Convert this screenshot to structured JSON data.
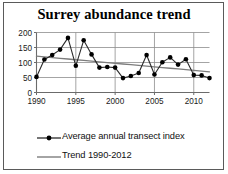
{
  "chart_data": {
    "type": "line",
    "title": "Surrey abundance trend",
    "xlabel": "",
    "ylabel": "",
    "xlim": [
      1990,
      2012
    ],
    "ylim": [
      0,
      200
    ],
    "grid": true,
    "legend_position": "bottom-left",
    "x": [
      1990,
      1991,
      1992,
      1993,
      1994,
      1995,
      1996,
      1997,
      1998,
      1999,
      2000,
      2001,
      2002,
      2003,
      2004,
      2005,
      2006,
      2007,
      2008,
      2009,
      2010,
      2011,
      2012
    ],
    "y_ticks": [
      0,
      50,
      100,
      150,
      200
    ],
    "y_tick_labels": [
      "0",
      "50",
      "100",
      "150",
      "200"
    ],
    "x_ticks": [
      1990,
      1995,
      2000,
      2005,
      2010
    ],
    "x_tick_labels": [
      "1990",
      "1995",
      "2000",
      "2005",
      "2010"
    ],
    "series": [
      {
        "name": "Average annual transect index",
        "style": "line-with-markers",
        "color": "#000000",
        "values": [
          52,
          110,
          125,
          143,
          182,
          89,
          174,
          127,
          83,
          85,
          83,
          48,
          55,
          65,
          125,
          60,
          101,
          117,
          93,
          111,
          58,
          57,
          48
        ]
      },
      {
        "name": "Trend 1990-2012",
        "style": "line",
        "color": "#7d7d7d",
        "values": [
          121,
          118.6,
          116.3,
          113.9,
          111.6,
          109.2,
          106.8,
          104.5,
          102.1,
          99.7,
          97.4,
          95,
          92.6,
          90.3,
          87.9,
          85.5,
          83.2,
          80.8,
          78.5,
          76.1,
          73.7,
          71.4,
          69
        ]
      }
    ],
    "legend": [
      {
        "label": "Average annual transect index",
        "marker": "line-marker"
      },
      {
        "label": "Trend 1990-2012",
        "marker": "line"
      }
    ]
  }
}
